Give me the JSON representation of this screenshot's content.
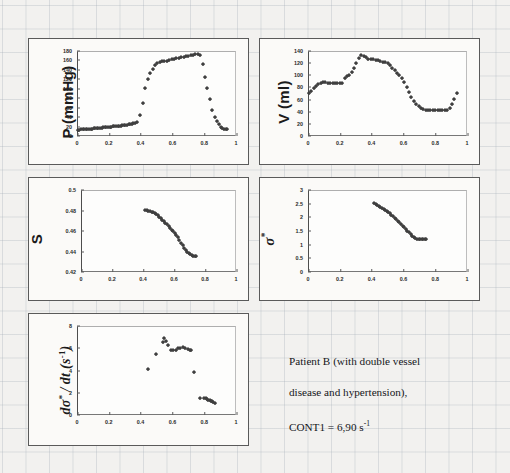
{
  "figure": {
    "caption_line1": "Patient B (with double vessel",
    "caption_line2": "disease and hypertension),",
    "caption_line3_prefix": "CONT1 = 6,90 s",
    "caption_line3_sup": "-1",
    "marker_color": "#3f3f3f",
    "panel_border_color": "#5a5a5a",
    "background_color": "#f2f1ef"
  },
  "chart_data": [
    {
      "id": "pressure",
      "type": "scatter",
      "title": "",
      "xlabel": "",
      "ylabel": "P (mmHg)",
      "xlim": [
        0,
        1
      ],
      "ylim": [
        0,
        180
      ],
      "xticks": [
        "0",
        "0.2",
        "0.4",
        "0.6",
        "0.8",
        "1"
      ],
      "xtick_values": [
        0,
        0.2,
        0.4,
        0.6,
        0.8,
        1
      ],
      "yticks": [
        "0",
        "20",
        "40",
        "60",
        "80",
        "100",
        "120",
        "140",
        "160",
        "180"
      ],
      "ytick_values": [
        0,
        20,
        40,
        60,
        80,
        100,
        120,
        140,
        160,
        180
      ],
      "grid": false,
      "legend": "none",
      "x": [
        0.005,
        0.015,
        0.025,
        0.035,
        0.045,
        0.055,
        0.065,
        0.075,
        0.085,
        0.095,
        0.105,
        0.115,
        0.125,
        0.135,
        0.145,
        0.155,
        0.165,
        0.175,
        0.185,
        0.195,
        0.205,
        0.215,
        0.225,
        0.235,
        0.245,
        0.255,
        0.265,
        0.275,
        0.285,
        0.295,
        0.305,
        0.315,
        0.325,
        0.335,
        0.345,
        0.355,
        0.365,
        0.375,
        0.395,
        0.415,
        0.43,
        0.445,
        0.46,
        0.475,
        0.49,
        0.505,
        0.52,
        0.535,
        0.55,
        0.565,
        0.58,
        0.595,
        0.61,
        0.625,
        0.64,
        0.655,
        0.67,
        0.685,
        0.7,
        0.715,
        0.73,
        0.745,
        0.76,
        0.775,
        0.79,
        0.805,
        0.82,
        0.835,
        0.85,
        0.865,
        0.88,
        0.895,
        0.905,
        0.915,
        0.925,
        0.935,
        0.945
      ],
      "y": [
        11,
        12,
        13,
        13,
        14,
        14,
        14,
        15,
        15,
        15,
        16,
        16,
        16,
        17,
        17,
        17,
        18,
        18,
        18,
        19,
        19,
        19,
        20,
        20,
        20,
        21,
        21,
        21,
        22,
        22,
        23,
        23,
        24,
        24,
        25,
        26,
        27,
        28,
        43,
        70,
        100,
        120,
        133,
        142,
        150,
        154,
        156,
        157,
        158,
        159,
        160,
        162,
        163,
        164,
        165,
        166,
        167,
        168,
        169,
        170,
        171,
        172,
        172,
        171,
        152,
        125,
        100,
        78,
        55,
        40,
        30,
        24,
        19,
        16,
        14,
        13,
        13
      ]
    },
    {
      "id": "volume",
      "type": "scatter",
      "title": "",
      "xlabel": "",
      "ylabel": "V (ml)",
      "xlim": [
        0,
        1
      ],
      "ylim": [
        0,
        140
      ],
      "xticks": [
        "0",
        "0.2",
        "0.4",
        "0.6",
        "0.8",
        "1"
      ],
      "xtick_values": [
        0,
        0.2,
        0.4,
        0.6,
        0.8,
        1
      ],
      "yticks": [
        "0",
        "20",
        "40",
        "60",
        "80",
        "100",
        "120",
        "140"
      ],
      "ytick_values": [
        0,
        20,
        40,
        60,
        80,
        100,
        120,
        140
      ],
      "grid": false,
      "legend": "none",
      "x": [
        0.005,
        0.02,
        0.035,
        0.05,
        0.065,
        0.08,
        0.095,
        0.11,
        0.125,
        0.14,
        0.155,
        0.17,
        0.185,
        0.2,
        0.215,
        0.23,
        0.245,
        0.26,
        0.275,
        0.29,
        0.305,
        0.32,
        0.335,
        0.35,
        0.365,
        0.38,
        0.395,
        0.41,
        0.425,
        0.44,
        0.455,
        0.47,
        0.485,
        0.5,
        0.515,
        0.53,
        0.545,
        0.56,
        0.575,
        0.59,
        0.605,
        0.62,
        0.635,
        0.65,
        0.665,
        0.68,
        0.695,
        0.71,
        0.725,
        0.74,
        0.755,
        0.77,
        0.785,
        0.8,
        0.815,
        0.83,
        0.845,
        0.86,
        0.875,
        0.89,
        0.905,
        0.92,
        0.935
      ],
      "y": [
        70,
        74,
        78,
        82,
        85,
        87,
        88,
        88,
        87,
        87,
        86,
        86,
        86,
        86,
        87,
        95,
        98,
        100,
        104,
        112,
        120,
        128,
        133,
        131,
        129,
        127,
        126,
        126,
        125,
        124,
        123,
        122,
        121,
        119,
        116,
        112,
        108,
        103,
        100,
        95,
        88,
        80,
        72,
        64,
        57,
        52,
        48,
        45,
        44,
        43,
        43,
        43,
        42,
        42,
        42,
        42,
        42,
        42,
        43,
        46,
        52,
        60,
        70
      ]
    },
    {
      "id": "stretch",
      "type": "scatter",
      "title": "",
      "xlabel": "",
      "ylabel": "S",
      "xlim": [
        0,
        1
      ],
      "ylim": [
        0.42,
        0.5
      ],
      "xticks": [
        "0",
        "0.2",
        "0.4",
        "0.6",
        "0.8",
        "1"
      ],
      "xtick_values": [
        0,
        0.2,
        0.4,
        0.6,
        0.8,
        1
      ],
      "yticks": [
        "0.42",
        "0.44",
        "0.46",
        "0.48",
        "0.5"
      ],
      "ytick_values": [
        0.42,
        0.44,
        0.46,
        0.48,
        0.5
      ],
      "grid": false,
      "legend": "none",
      "x": [
        0.415,
        0.425,
        0.435,
        0.445,
        0.455,
        0.465,
        0.475,
        0.485,
        0.495,
        0.505,
        0.515,
        0.525,
        0.535,
        0.545,
        0.555,
        0.565,
        0.575,
        0.585,
        0.595,
        0.605,
        0.615,
        0.625,
        0.635,
        0.645,
        0.655,
        0.665,
        0.675,
        0.685,
        0.695,
        0.705,
        0.715,
        0.725,
        0.735,
        0.745
      ],
      "y": [
        0.48,
        0.4798,
        0.4795,
        0.479,
        0.4785,
        0.4778,
        0.477,
        0.476,
        0.4748,
        0.4735,
        0.4722,
        0.4708,
        0.4693,
        0.4678,
        0.4662,
        0.4645,
        0.4628,
        0.461,
        0.4592,
        0.4575,
        0.4558,
        0.454,
        0.451,
        0.448,
        0.4455,
        0.4432,
        0.4412,
        0.4395,
        0.4382,
        0.4372,
        0.4363,
        0.4357,
        0.4352,
        0.4348
      ]
    },
    {
      "id": "sigma-star",
      "type": "scatter",
      "title": "",
      "xlabel": "",
      "ylabel": "σ*",
      "xlim": [
        0,
        1
      ],
      "ylim": [
        0,
        3
      ],
      "xticks": [
        "0",
        "0.2",
        "0.4",
        "0.6",
        "0.8",
        "1"
      ],
      "xtick_values": [
        0,
        0.2,
        0.4,
        0.6,
        0.8,
        1
      ],
      "yticks": [
        "0",
        "0.5",
        "1",
        "1.5",
        "2",
        "2.5",
        "3"
      ],
      "ytick_values": [
        0,
        0.5,
        1,
        1.5,
        2,
        2.5,
        3
      ],
      "grid": false,
      "legend": "none",
      "x": [
        0.415,
        0.425,
        0.435,
        0.445,
        0.455,
        0.465,
        0.475,
        0.485,
        0.495,
        0.505,
        0.515,
        0.525,
        0.535,
        0.545,
        0.555,
        0.565,
        0.575,
        0.585,
        0.595,
        0.605,
        0.615,
        0.625,
        0.635,
        0.645,
        0.655,
        0.665,
        0.675,
        0.685,
        0.695,
        0.705,
        0.715,
        0.725,
        0.735,
        0.745
      ],
      "y": [
        2.5,
        2.47,
        2.44,
        2.41,
        2.38,
        2.34,
        2.3,
        2.26,
        2.22,
        2.18,
        2.13,
        2.08,
        2.03,
        1.97,
        1.92,
        1.86,
        1.8,
        1.74,
        1.68,
        1.62,
        1.56,
        1.5,
        1.44,
        1.38,
        1.32,
        1.27,
        1.23,
        1.2,
        1.19,
        1.18,
        1.18,
        1.18,
        1.18,
        1.18
      ]
    },
    {
      "id": "dsigma-dt",
      "type": "scatter",
      "title": "",
      "xlabel": "",
      "ylabel": "dσ* / dt (s-1)",
      "xlim": [
        0,
        1
      ],
      "ylim": [
        0,
        8
      ],
      "xticks": [
        "0",
        "0.2",
        "0.4",
        "0.6",
        "0.8",
        "1"
      ],
      "xtick_values": [
        0,
        0.2,
        0.4,
        0.6,
        0.8,
        1
      ],
      "yticks": [
        "0",
        "2",
        "4",
        "6",
        "8"
      ],
      "ytick_values": [
        0,
        2,
        4,
        6,
        8
      ],
      "grid": false,
      "legend": "none",
      "x": [
        0.445,
        0.495,
        0.54,
        0.548,
        0.56,
        0.572,
        0.59,
        0.605,
        0.62,
        0.635,
        0.65,
        0.665,
        0.68,
        0.695,
        0.71,
        0.718,
        0.735,
        0.775,
        0.8,
        0.81,
        0.818,
        0.826,
        0.834,
        0.842,
        0.85,
        0.858,
        0.866
      ],
      "y": [
        4.1,
        5.45,
        6.55,
        6.85,
        6.6,
        6.3,
        5.85,
        5.8,
        5.85,
        5.95,
        6.0,
        6.05,
        5.95,
        5.9,
        5.85,
        5.8,
        3.85,
        1.45,
        1.5,
        1.45,
        1.4,
        1.35,
        1.3,
        1.25,
        1.2,
        1.15,
        1.05
      ]
    }
  ]
}
